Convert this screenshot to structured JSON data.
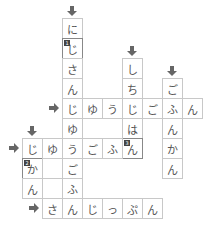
{
  "puzzle": {
    "type": "crossword",
    "cell_size": 20,
    "origin_x": 22,
    "origin_y": 18,
    "cells": [
      {
        "r": 0,
        "c": 2,
        "ch": "に"
      },
      {
        "r": 1,
        "c": 2,
        "ch": "じ",
        "num": "1"
      },
      {
        "r": 2,
        "c": 2,
        "ch": "さ"
      },
      {
        "r": 3,
        "c": 2,
        "ch": "ん"
      },
      {
        "r": 4,
        "c": 2,
        "ch": "じ"
      },
      {
        "r": 4,
        "c": 3,
        "ch": "ゆ"
      },
      {
        "r": 4,
        "c": 4,
        "ch": "う"
      },
      {
        "r": 4,
        "c": 5,
        "ch": "じ"
      },
      {
        "r": 4,
        "c": 6,
        "ch": "ご"
      },
      {
        "r": 4,
        "c": 7,
        "ch": "ふ"
      },
      {
        "r": 4,
        "c": 8,
        "ch": "ん"
      },
      {
        "r": 5,
        "c": 2,
        "ch": "ゆ"
      },
      {
        "r": 6,
        "c": 2,
        "ch": "う"
      },
      {
        "r": 7,
        "c": 2,
        "ch": "ご"
      },
      {
        "r": 8,
        "c": 2,
        "ch": "ふ"
      },
      {
        "r": 2,
        "c": 5,
        "ch": "し"
      },
      {
        "r": 3,
        "c": 5,
        "ch": "ち"
      },
      {
        "r": 5,
        "c": 5,
        "ch": "は"
      },
      {
        "r": 6,
        "c": 5,
        "ch": "ん",
        "num": "3"
      },
      {
        "r": 3,
        "c": 7,
        "ch": "ご"
      },
      {
        "r": 5,
        "c": 7,
        "ch": "ん"
      },
      {
        "r": 6,
        "c": 7,
        "ch": "か"
      },
      {
        "r": 7,
        "c": 7,
        "ch": "ん"
      },
      {
        "r": 6,
        "c": 0,
        "ch": "じ"
      },
      {
        "r": 6,
        "c": 1,
        "ch": "ゆ"
      },
      {
        "r": 6,
        "c": 3,
        "ch": "ご"
      },
      {
        "r": 6,
        "c": 4,
        "ch": "ふ"
      },
      {
        "r": 7,
        "c": 0,
        "ch": "か",
        "num": "2"
      },
      {
        "r": 8,
        "c": 0,
        "ch": "ん"
      },
      {
        "r": 7,
        "c": 1,
        "ch": ""
      },
      {
        "r": 9,
        "c": 1,
        "ch": "さ"
      },
      {
        "r": 9,
        "c": 2,
        "ch": "ん"
      },
      {
        "r": 9,
        "c": 3,
        "ch": "じ"
      },
      {
        "r": 9,
        "c": 4,
        "ch": "っ"
      },
      {
        "r": 9,
        "c": 5,
        "ch": "ぷ"
      },
      {
        "r": 9,
        "c": 6,
        "ch": "ん"
      }
    ],
    "arrows_down": [
      {
        "r": 0,
        "c": 2
      },
      {
        "r": 2,
        "c": 5
      },
      {
        "r": 3,
        "c": 7
      },
      {
        "r": 6,
        "c": 0
      }
    ],
    "arrows_right": [
      {
        "r": 4,
        "c": 2
      },
      {
        "r": 6,
        "c": 0
      },
      {
        "r": 9,
        "c": 1
      }
    ],
    "words": {
      "down_1": "にじさんじゆうごふ",
      "down_2": "しちじはん",
      "down_3": "ごふんかん",
      "down_4": "じかん",
      "across_1": "じゆうじごふん",
      "across_2": "じゆうごふん",
      "across_3": "さんじっぷん"
    }
  },
  "colors": {
    "cell_border": "#c8c8c8",
    "text": "#555555",
    "arrow": "#666666",
    "number_bg": "#444444"
  }
}
